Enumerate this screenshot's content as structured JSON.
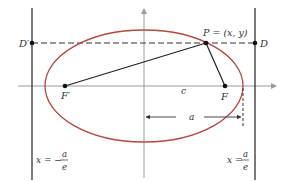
{
  "diagram": {
    "colors": {
      "ellipse": "#b5473f",
      "lines": "#222222",
      "axes": "#9a9a9a",
      "text": "#333333"
    },
    "labels": {
      "d_prime": "D′",
      "d": "D",
      "p": "P = (x, y)",
      "f_prime": "F′",
      "f": "F",
      "c": "c",
      "a": "a",
      "left_directrix_lhs": "x = −",
      "right_directrix_lhs": "x =",
      "frac_num": "a",
      "frac_den": "e"
    }
  }
}
